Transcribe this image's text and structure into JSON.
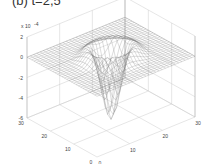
{
  "chart_data": {
    "type": "surface",
    "title": "(b) t=2,5",
    "z_multiplier_label": "x 10",
    "z_multiplier_exp": "-4",
    "zlim": [
      -6,
      2
    ],
    "z_ticks": [
      "2",
      "0",
      "-2",
      "-4",
      "-6"
    ],
    "x_ticks": [
      "0",
      "10",
      "20",
      "30"
    ],
    "y_ticks": [
      "0",
      "10",
      "20",
      "30"
    ],
    "xlim": [
      0,
      30
    ],
    "ylim": [
      0,
      30
    ],
    "surface": {
      "description": "flat plane at z=0 with raised ring around center and deep central well",
      "grid_size": 31,
      "center": [
        15,
        15
      ],
      "well_depth": -6,
      "ring_height": 0.6
    },
    "grid": true
  }
}
